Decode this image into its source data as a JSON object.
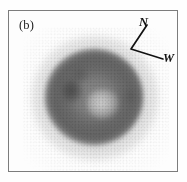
{
  "figure": {
    "panel_label": "(b)",
    "frame_color": "#7c7c7c",
    "background_color": "#fefefe",
    "ink_color": "#111111"
  },
  "compass": {
    "north_label": "N",
    "west_label": "W",
    "vertex": {
      "x": 12,
      "y": 34
    },
    "north_tip": {
      "x": 28,
      "y": 10
    },
    "west_tip": {
      "x": 44,
      "y": 44
    }
  },
  "object": {
    "center": {
      "x": 85,
      "y": 86
    },
    "core_radius_px": 46,
    "halo_radius_px": 64,
    "features": [
      {
        "name": "bright-core",
        "x": 94,
        "y": 93,
        "tone": "light"
      },
      {
        "name": "dark-knot-left",
        "x": 63,
        "y": 80,
        "tone": "dark"
      },
      {
        "name": "dark-knot-upper",
        "x": 71,
        "y": 64,
        "tone": "dark"
      },
      {
        "name": "dark-knot-right",
        "x": 121,
        "y": 85,
        "tone": "dark"
      },
      {
        "name": "dark-ring",
        "x": 85,
        "y": 86,
        "tone": "dark"
      }
    ]
  }
}
